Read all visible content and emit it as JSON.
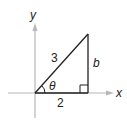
{
  "diagram": {
    "axes": {
      "x_label": "x",
      "y_label": "y",
      "axis_color": "#b8b8b8"
    },
    "triangle": {
      "hypotenuse_label": "3",
      "opposite_label": "b",
      "adjacent_label": "2",
      "angle_label": "θ",
      "has_right_angle_marker": true,
      "line_color": "#222222"
    }
  }
}
